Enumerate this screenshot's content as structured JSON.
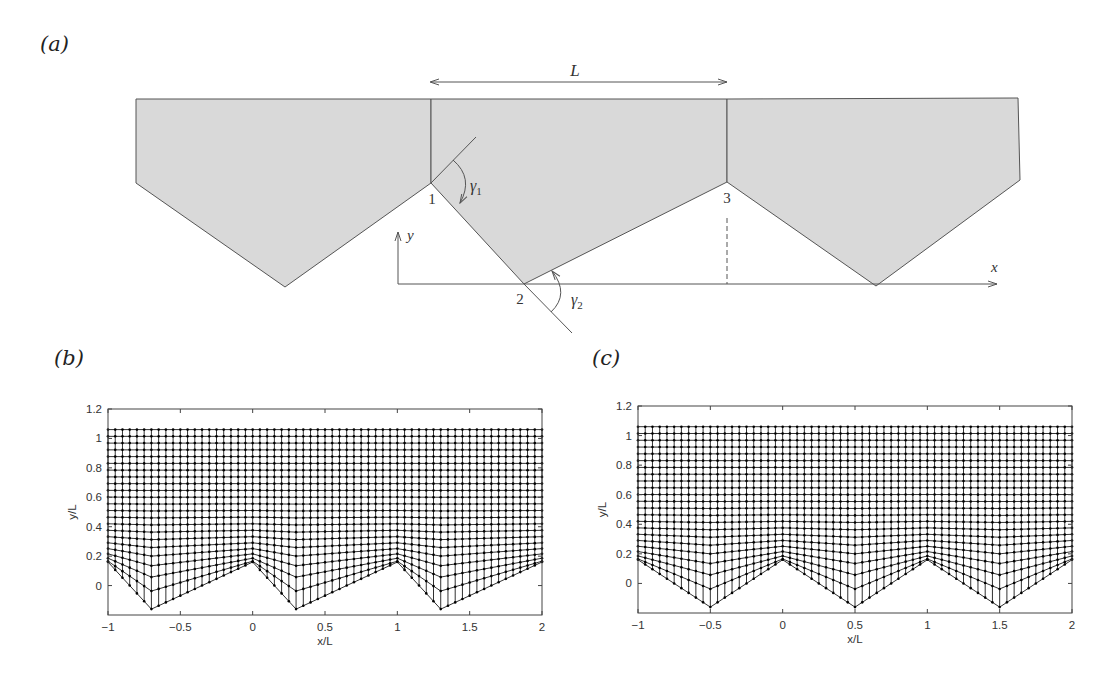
{
  "figure": {
    "panels": [
      {
        "id": "a",
        "label": "(a)"
      },
      {
        "id": "b",
        "label": "(b)"
      },
      {
        "id": "c",
        "label": "(c)"
      }
    ],
    "schematic": {
      "length_label": "L",
      "point_labels": [
        "1",
        "2",
        "3"
      ],
      "angle_labels": [
        "γ1",
        "γ2"
      ],
      "axis_labels": {
        "x": "x",
        "y": "y"
      },
      "fill_color": "#d9d9d9",
      "line_color": "#555555"
    }
  },
  "chart_data": [
    {
      "type": "scatter",
      "panel": "b",
      "title": "",
      "xlabel": "x/L",
      "ylabel": "y/L",
      "xlim": [
        -1,
        2
      ],
      "ylim": [
        -0.2,
        1.2
      ],
      "xticks": [
        "-1",
        "-0.5",
        "0",
        "0.5",
        "1",
        "1.5",
        "2"
      ],
      "yticks": [
        "0",
        "0.2",
        "0.4",
        "0.6",
        "0.8",
        "1",
        "1.2"
      ],
      "description": "Curvilinear computational mesh above asymmetric sawtooth wall",
      "wall_apex_x": [
        -1,
        0,
        1,
        2
      ],
      "wall_apex_y": 0.16,
      "wall_trough_x": [
        -0.7,
        0.3,
        1.3
      ],
      "wall_trough_y": -0.16,
      "mesh_top_y": 1.06,
      "grid": false
    },
    {
      "type": "scatter",
      "panel": "c",
      "title": "",
      "xlabel": "x/L",
      "ylabel": "y/L",
      "xlim": [
        -1,
        2
      ],
      "ylim": [
        -0.2,
        1.2
      ],
      "xticks": [
        "-1",
        "-0.5",
        "0",
        "0.5",
        "1",
        "1.5",
        "2"
      ],
      "yticks": [
        "0",
        "0.2",
        "0.4",
        "0.6",
        "0.8",
        "1",
        "1.2"
      ],
      "description": "Curvilinear computational mesh above symmetric sawtooth wall",
      "wall_apex_x": [
        -1,
        0,
        1,
        2
      ],
      "wall_apex_y": 0.16,
      "wall_trough_x": [
        -0.5,
        0.5,
        1.5
      ],
      "wall_trough_y": -0.16,
      "mesh_top_y": 1.06,
      "grid": false
    }
  ]
}
